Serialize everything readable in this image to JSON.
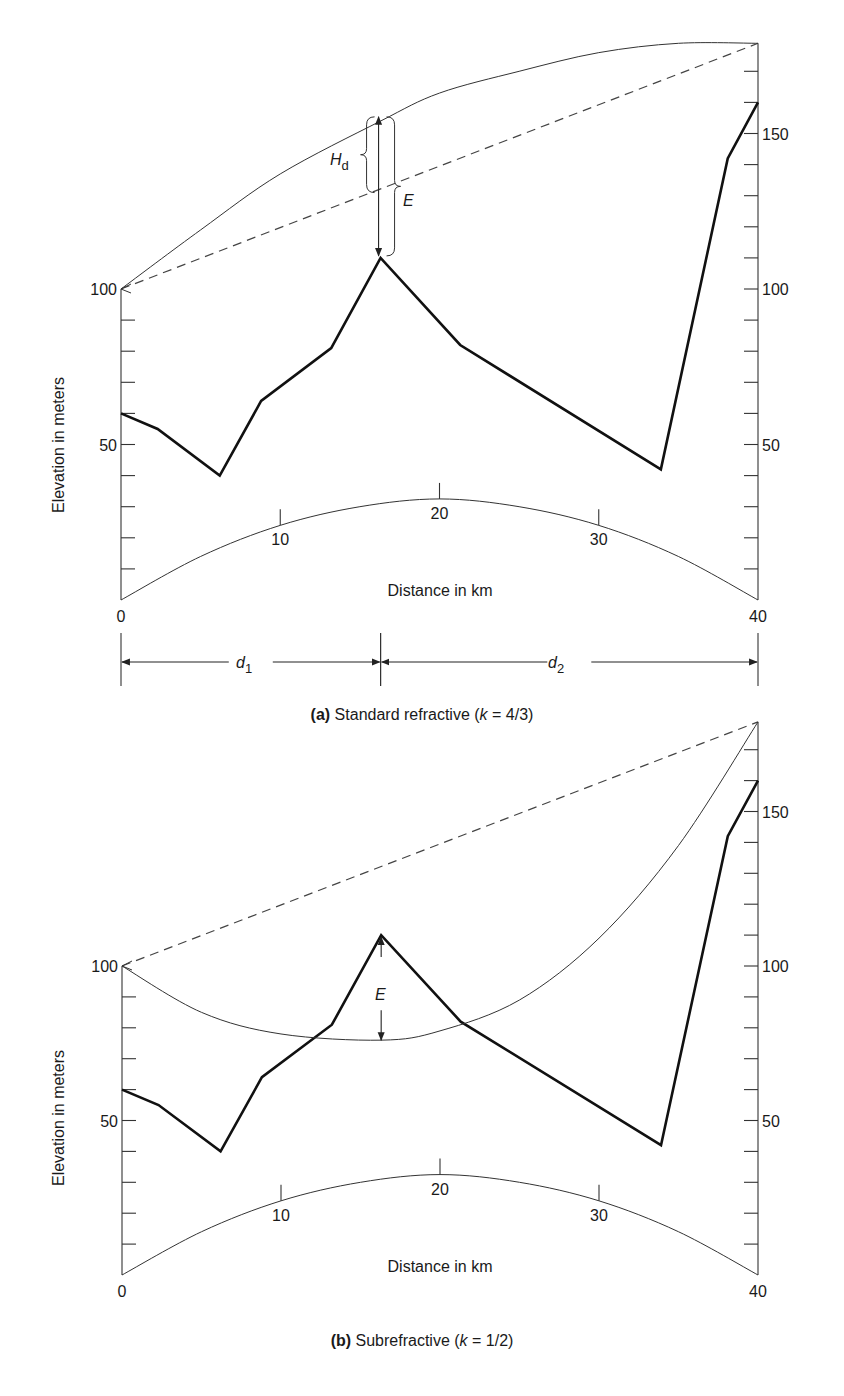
{
  "figure": {
    "panels": [
      {
        "id": "a",
        "caption_label": "(a)",
        "caption_text": " Standard refractive (",
        "caption_k": "k",
        "caption_rest": " = 4/3)",
        "annotations": {
          "hd": "H",
          "hd_sub": "d",
          "e": "E",
          "d1": "d",
          "d1_sub": "1",
          "d2": "d",
          "d2_sub": "2"
        }
      },
      {
        "id": "b",
        "caption_label": "(b)",
        "caption_text": " Subrefractive (",
        "caption_k": "k",
        "caption_rest": " = 1/2)",
        "annotations": {
          "e": "E"
        }
      }
    ],
    "ylabel": "Elevation in meters",
    "xlabel": "Distance in km"
  },
  "chart_data": [
    {
      "type": "line",
      "title": "(a) Standard refractive (k = 4/3)",
      "xlabel": "Distance in km",
      "ylabel": "Elevation in meters",
      "xlim": [
        0,
        40
      ],
      "ylim": [
        0,
        180
      ],
      "x_ticks": [
        0,
        10,
        20,
        30,
        40
      ],
      "y_ticks_left": [
        0,
        50,
        100
      ],
      "y_ticks_right": [
        50,
        100,
        150
      ],
      "minor_y_tick_step": 10,
      "grid": false,
      "series": [
        {
          "name": "terrain profile",
          "style": "bold",
          "x": [
            0,
            2.3,
            6.2,
            8.8,
            13.2,
            16.3,
            21.3,
            33.9,
            38.1,
            40
          ],
          "y": [
            60,
            55,
            40,
            64,
            81,
            110,
            82,
            42,
            142,
            160
          ]
        },
        {
          "name": "line of sight",
          "style": "dashed",
          "x": [
            0,
            40
          ],
          "y": [
            100,
            179
          ]
        },
        {
          "name": "ray path (k = 4/3)",
          "style": "thin",
          "x": [
            0,
            5,
            10,
            16.3,
            20,
            25,
            30,
            35,
            40
          ],
          "y": [
            100,
            119,
            137,
            154,
            163,
            170,
            176,
            179,
            179
          ]
        },
        {
          "name": "earth bulge reference",
          "style": "thin",
          "x": [
            0,
            5,
            10,
            15,
            20,
            25,
            30,
            35,
            40
          ],
          "y": [
            0,
            14,
            24,
            30,
            32.5,
            30,
            24,
            14,
            0
          ]
        }
      ],
      "annotations": [
        {
          "label": "H_d",
          "x": 16.3,
          "from": 131,
          "to": 156
        },
        {
          "label": "E",
          "x": 16.3,
          "from": 110,
          "to": 156
        },
        {
          "label": "d_1",
          "from_km": 0,
          "to_km": 16.3
        },
        {
          "label": "d_2",
          "from_km": 16.3,
          "to_km": 40
        }
      ]
    },
    {
      "type": "line",
      "title": "(b) Subrefractive (k = 1/2)",
      "xlabel": "Distance in km",
      "ylabel": "Elevation in meters",
      "xlim": [
        0,
        40
      ],
      "ylim": [
        0,
        180
      ],
      "x_ticks": [
        0,
        10,
        20,
        30,
        40
      ],
      "y_ticks_left": [
        0,
        50,
        100
      ],
      "y_ticks_right": [
        50,
        100,
        150
      ],
      "minor_y_tick_step": 10,
      "grid": false,
      "series": [
        {
          "name": "terrain profile",
          "style": "bold",
          "x": [
            0,
            2.3,
            6.2,
            8.8,
            13.2,
            16.3,
            21.3,
            33.9,
            38.1,
            40
          ],
          "y": [
            60,
            55,
            40,
            64,
            81,
            110,
            82,
            42,
            142,
            160
          ]
        },
        {
          "name": "line of sight",
          "style": "dashed",
          "x": [
            0,
            40
          ],
          "y": [
            100,
            179
          ]
        },
        {
          "name": "ray path (k = 1/2)",
          "style": "thin",
          "x": [
            0,
            5,
            10,
            16.3,
            20,
            25,
            30,
            35,
            40
          ],
          "y": [
            100,
            85,
            78,
            76,
            79,
            89,
            109,
            139,
            179
          ]
        },
        {
          "name": "earth bulge reference",
          "style": "thin",
          "x": [
            0,
            5,
            10,
            15,
            20,
            25,
            30,
            35,
            40
          ],
          "y": [
            0,
            14,
            24,
            30,
            32.5,
            30,
            24,
            14,
            0
          ]
        }
      ],
      "annotations": [
        {
          "label": "E",
          "x": 16.3,
          "from": 76,
          "to": 110
        }
      ]
    }
  ]
}
